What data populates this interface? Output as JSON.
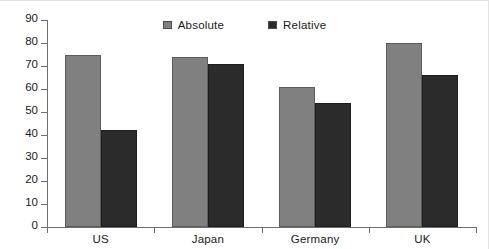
{
  "chart_data": {
    "type": "bar",
    "title": "",
    "subtitle": "",
    "xlabel": "",
    "ylabel": "",
    "categories": [
      "US",
      "Japan",
      "Germany",
      "UK"
    ],
    "series": [
      {
        "name": "Absolute",
        "color": "#808080",
        "values": [
          75,
          74,
          61,
          80
        ]
      },
      {
        "name": "Relative",
        "color": "#2b2b2b",
        "values": [
          42,
          71,
          54,
          66
        ]
      }
    ],
    "ylim": [
      0,
      90
    ],
    "ytick_step": 10,
    "yticks": [
      0,
      10,
      20,
      30,
      40,
      50,
      60,
      70,
      80,
      90
    ],
    "ytick_labels": [
      "0",
      "10",
      "20",
      "30",
      "40",
      "50",
      "60",
      "70",
      "80",
      "90"
    ],
    "grid": false,
    "legend_position": "top-center",
    "annotations": []
  },
  "legend": {
    "entries": [
      {
        "label": "Absolute",
        "swatch_color": "#808080"
      },
      {
        "label": "Relative",
        "swatch_color": "#2b2b2b"
      }
    ]
  },
  "axis": {
    "line_color": "#6e6e6e",
    "text_color": "#1a1a1a"
  },
  "figure": {
    "background": "#ffffff",
    "border_color": "#e3e3e3"
  }
}
